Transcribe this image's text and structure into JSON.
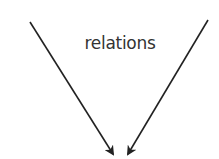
{
  "diagram": {
    "label": "relations",
    "stroke_color": "#222222",
    "arrows": [
      {
        "name": "left-arrow",
        "from": [
          30,
          22
        ],
        "to": [
          114,
          156
        ]
      },
      {
        "name": "right-arrow",
        "from": [
          208,
          20
        ],
        "to": [
          127,
          156
        ]
      }
    ]
  }
}
